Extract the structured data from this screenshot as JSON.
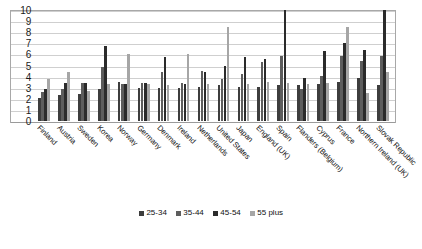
{
  "chart_data": {
    "type": "bar",
    "title": "",
    "xlabel": "",
    "ylabel": "",
    "ylim": [
      0,
      10
    ],
    "grid": true,
    "legend_position": "bottom",
    "y_ticks": [
      "0",
      "1",
      "2",
      "3",
      "4",
      "5",
      "6",
      "7",
      "8",
      "9",
      "10"
    ],
    "categories": [
      "Finland",
      "Austria",
      "Sweden",
      "Korea",
      "Norway",
      "Germany",
      "Denmark",
      "Ireland",
      "Netherlands",
      "United States",
      "Japan",
      "England (UK)",
      "Spain",
      "Flanders (Belgium)",
      "Cyprus",
      "France",
      "Northern Ireland (UK)",
      "Slovak Republic"
    ],
    "series": [
      {
        "name": "25-34",
        "color": "#3d3d3d",
        "values": [
          2.1,
          2.3,
          2.4,
          2.9,
          3.5,
          3.0,
          3.0,
          3.0,
          3.1,
          3.2,
          3.1,
          3.1,
          3.2,
          3.2,
          3.3,
          3.5,
          3.9,
          3.2
        ]
      },
      {
        "name": "35-44",
        "color": "#5d5d5d",
        "values": [
          2.6,
          2.9,
          3.4,
          4.9,
          3.3,
          3.4,
          4.4,
          3.4,
          4.5,
          3.8,
          4.2,
          5.3,
          5.9,
          2.9,
          4.1,
          5.9,
          5.4,
          5.9
        ]
      },
      {
        "name": "45-54",
        "color": "#2b2b2b",
        "values": [
          2.9,
          3.4,
          3.4,
          6.8,
          3.3,
          3.4,
          5.8,
          3.3,
          4.4,
          5.0,
          5.8,
          5.6,
          10.0,
          3.9,
          6.3,
          7.0,
          6.4,
          10.0
        ]
      },
      {
        "name": "55 plus",
        "color": "#a6a6a6",
        "values": [
          3.8,
          4.4,
          2.7,
          3.3,
          6.0,
          3.3,
          3.2,
          6.0,
          3.3,
          8.5,
          3.3,
          3.5,
          3.4,
          3.3,
          3.4,
          8.5,
          2.5,
          4.4
        ]
      }
    ],
    "legend": [
      "25-34",
      "35-44",
      "45-54",
      "55 plus"
    ]
  }
}
